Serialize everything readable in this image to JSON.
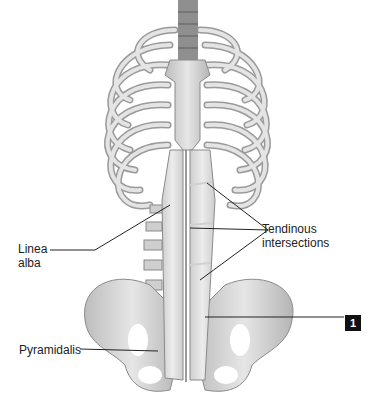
{
  "figure": {
    "labels": {
      "linea_alba_line1": "Linea",
      "linea_alba_line2": "alba",
      "tendinous_line1": "Tendinous",
      "tendinous_line2": "intersections",
      "pyramidalis": "Pyramidalis"
    },
    "numbered_callout": "1"
  },
  "colors": {
    "background": "#ffffff",
    "bone": "#d9d9d9",
    "bone_shade": "#a8a8a8",
    "muscle": "#e3e3e3",
    "leader_line": "#222222",
    "badge": "#111111"
  }
}
